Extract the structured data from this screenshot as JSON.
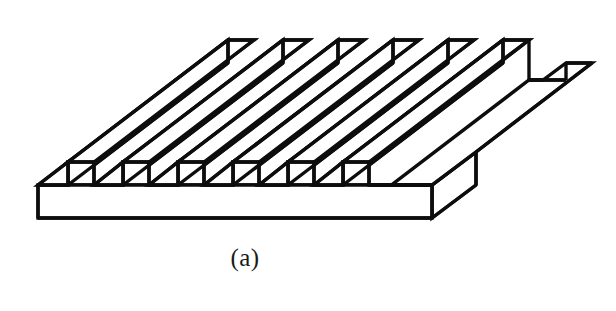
{
  "figure": {
    "caption": "(a)",
    "line_color": "#0d0d0d",
    "fill_color": "#ffffff",
    "background_color": "#ffffff",
    "stroke_width": 3.4,
    "rib_count": 6,
    "notch_count": 6
  },
  "geometry": {
    "canvas": {
      "width": 616,
      "height": 311
    },
    "base_plate": {
      "front_bottom_left": [
        38,
        218
      ],
      "front_bottom_right": [
        432,
        218
      ],
      "front_top_left": [
        38,
        185
      ],
      "front_top_right": [
        432,
        185
      ],
      "right_back_top": [
        476,
        152
      ],
      "depth_vector": [
        44,
        -33
      ]
    },
    "rib_axis_vector": [
      160,
      -122
    ],
    "rib_pitch_x": 55,
    "rib_top_width": 26,
    "rib_height": 23,
    "notch_gap": 29,
    "ribs": [
      {
        "index": 1,
        "front_base_left_x": 68,
        "front_base_right_x": 94,
        "top_y": 162
      },
      {
        "index": 2,
        "front_base_left_x": 123,
        "front_base_right_x": 149,
        "top_y": 162
      },
      {
        "index": 3,
        "front_base_left_x": 178,
        "front_base_right_x": 204,
        "top_y": 162
      },
      {
        "index": 4,
        "front_base_left_x": 233,
        "front_base_right_x": 259,
        "top_y": 162
      },
      {
        "index": 5,
        "front_base_left_x": 288,
        "front_base_right_x": 314,
        "top_y": 162
      },
      {
        "index": 6,
        "front_base_left_x": 343,
        "front_base_right_x": 369,
        "top_y": 162
      }
    ]
  },
  "labels": {
    "plate_name": "grooved-plate",
    "caption_name": "figure-caption"
  }
}
